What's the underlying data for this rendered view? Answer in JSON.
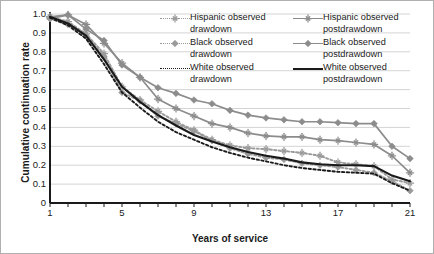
{
  "chart_data": {
    "type": "line",
    "title": "",
    "xlabel": "Years of service",
    "ylabel": "Cumulative continuation rate",
    "xlim": [
      1,
      21
    ],
    "ylim": [
      0,
      1.0
    ],
    "grid": "horizontal",
    "legend_position": "top-right-inside",
    "x": [
      1,
      2,
      3,
      4,
      5,
      6,
      7,
      8,
      9,
      10,
      11,
      12,
      13,
      14,
      15,
      16,
      17,
      18,
      19,
      20,
      21
    ],
    "xticks": [
      1,
      5,
      9,
      13,
      17,
      21
    ],
    "xtick_labels": [
      "1",
      "5",
      "9",
      "13",
      "17",
      "21"
    ],
    "yticks": [
      0,
      0.1,
      0.2,
      0.3,
      0.4,
      0.5,
      0.6,
      0.7,
      0.8,
      0.9,
      1.0
    ],
    "ytick_labels": [
      "0",
      "0.1",
      "0.2",
      "0.3",
      "0.4",
      "0.5",
      "0.6",
      "0.7",
      "0.8",
      "0.9",
      "1.0"
    ],
    "series": [
      {
        "name": "Black observed postdrawdown",
        "key": "black-post",
        "color": "#8c8c8c",
        "dash": "solid",
        "marker": "diamond",
        "values": [
          0.975,
          0.995,
          0.92,
          0.86,
          0.73,
          0.665,
          0.61,
          0.58,
          0.545,
          0.525,
          0.49,
          0.465,
          0.45,
          0.44,
          0.43,
          0.43,
          0.425,
          0.42,
          0.42,
          0.3,
          0.235
        ]
      },
      {
        "name": "Hispanic observed postdrawdown",
        "key": "hispanic-post",
        "color": "#8c8c8c",
        "dash": "solid",
        "marker": "asterisk",
        "values": [
          0.985,
          0.995,
          0.945,
          0.845,
          0.74,
          0.665,
          0.55,
          0.5,
          0.46,
          0.42,
          0.4,
          0.37,
          0.355,
          0.35,
          0.35,
          0.335,
          0.33,
          0.32,
          0.31,
          0.25,
          0.16
        ]
      },
      {
        "name": "Hispanic observed drawdown",
        "key": "hispanic-draw",
        "color": "#9a9a9a",
        "dash": "dotted",
        "marker": "asterisk",
        "values": [
          0.985,
          0.96,
          0.895,
          0.79,
          0.615,
          0.545,
          0.485,
          0.43,
          0.385,
          0.335,
          0.305,
          0.29,
          0.285,
          0.275,
          0.265,
          0.25,
          0.215,
          0.205,
          0.195,
          0.125,
          0.105
        ]
      },
      {
        "name": "Black observed drawdown",
        "key": "black-draw",
        "color": "#9a9a9a",
        "dash": "dotted",
        "marker": "diamond",
        "values": [
          0.975,
          0.945,
          0.885,
          0.775,
          0.585,
          0.54,
          0.46,
          0.42,
          0.38,
          0.33,
          0.29,
          0.26,
          0.24,
          0.23,
          0.21,
          0.2,
          0.19,
          0.175,
          0.16,
          0.115,
          0.065
        ]
      },
      {
        "name": "White observed postdrawdown",
        "key": "white-post",
        "color": "#1a1a1a",
        "dash": "solid",
        "marker": "none",
        "values": [
          0.985,
          0.95,
          0.885,
          0.76,
          0.615,
          0.535,
          0.465,
          0.41,
          0.36,
          0.325,
          0.295,
          0.27,
          0.25,
          0.235,
          0.215,
          0.205,
          0.2,
          0.2,
          0.195,
          0.145,
          0.115
        ]
      },
      {
        "name": "White observed drawdown",
        "key": "white-draw",
        "color": "#1a1a1a",
        "dash": "dotted",
        "marker": "none",
        "values": [
          0.98,
          0.94,
          0.87,
          0.735,
          0.585,
          0.505,
          0.43,
          0.375,
          0.335,
          0.295,
          0.265,
          0.24,
          0.22,
          0.2,
          0.185,
          0.175,
          0.165,
          0.16,
          0.155,
          0.105,
          0.065
        ]
      }
    ],
    "legend": [
      {
        "label_line1": "Hispanic observed",
        "label_line2": "drawdown",
        "key": "hispanic-draw"
      },
      {
        "label_line1": "Hispanic observed",
        "label_line2": "postdrawdown",
        "key": "hispanic-post"
      },
      {
        "label_line1": "Black observed",
        "label_line2": "drawdown",
        "key": "black-draw"
      },
      {
        "label_line1": "Black observed",
        "label_line2": "postdrawdown",
        "key": "black-post"
      },
      {
        "label_line1": "White observed",
        "label_line2": "drawdown",
        "key": "white-draw"
      },
      {
        "label_line1": "White observed",
        "label_line2": "postdrawdown",
        "key": "white-post"
      }
    ]
  },
  "style": {
    "gridline_color": "#d4d4d4",
    "axis_color": "#1a1a1a",
    "background": "#ffffff",
    "border_color": "#b0b0b0"
  }
}
